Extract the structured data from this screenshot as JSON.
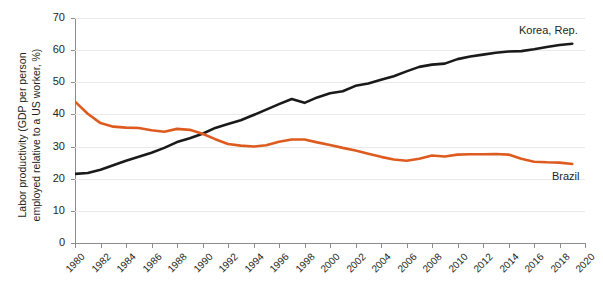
{
  "title_sliver": "",
  "axes": {
    "ylabel_line1": "Labor productivity (GDP per person",
    "ylabel_line2": "employed relative to a US worker, %)",
    "xlabel": "",
    "yticks": [
      "0",
      "10",
      "20",
      "30",
      "40",
      "50",
      "60",
      "70"
    ],
    "xticks": [
      "1980",
      "1982",
      "1984",
      "1986",
      "1988",
      "1990",
      "1992",
      "1994",
      "1996",
      "1998",
      "2000",
      "2002",
      "2004",
      "2006",
      "2008",
      "2010",
      "2012",
      "2014",
      "2016",
      "2018",
      "2020"
    ]
  },
  "labels": {
    "korea": "Korea, Rep.",
    "brazil": "Brazil"
  },
  "colors": {
    "korea": "#1a1a1a",
    "brazil": "#de5b1f",
    "grid": "#e9e9e9",
    "axis": "#8c8c8c",
    "text": "#231f20",
    "background": "#ffffff"
  },
  "chart_data": {
    "type": "line",
    "title": "",
    "xlabel": "",
    "ylabel": "Labor productivity (GDP per person employed relative to a US worker, %)",
    "xlim": [
      1980,
      2020
    ],
    "ylim": [
      0,
      70
    ],
    "grid": true,
    "legend": "inline-end-labels",
    "x": [
      1980,
      1981,
      1982,
      1983,
      1984,
      1985,
      1986,
      1987,
      1988,
      1989,
      1990,
      1991,
      1992,
      1993,
      1994,
      1995,
      1996,
      1997,
      1998,
      1999,
      2000,
      2001,
      2002,
      2003,
      2004,
      2005,
      2006,
      2007,
      2008,
      2009,
      2010,
      2011,
      2012,
      2013,
      2014,
      2015,
      2016,
      2017,
      2018,
      2019
    ],
    "series": [
      {
        "name": "Korea, Rep.",
        "color": "#1a1a1a",
        "values": [
          21.5,
          21.8,
          22.8,
          24.2,
          25.6,
          26.8,
          28.1,
          29.6,
          31.4,
          32.6,
          34.0,
          35.8,
          37.0,
          38.2,
          39.8,
          41.5,
          43.2,
          44.8,
          43.6,
          45.3,
          46.6,
          47.2,
          48.9,
          49.6,
          50.8,
          51.9,
          53.4,
          54.8,
          55.5,
          55.8,
          57.2,
          58.0,
          58.6,
          59.2,
          59.6,
          59.7,
          60.3,
          61.0,
          61.6,
          62.0
        ]
      },
      {
        "name": "Brazil",
        "color": "#de5b1f",
        "values": [
          44.0,
          40.2,
          37.3,
          36.2,
          35.9,
          35.8,
          35.1,
          34.6,
          35.5,
          35.2,
          34.0,
          32.3,
          30.8,
          30.3,
          30.0,
          30.4,
          31.5,
          32.2,
          32.2,
          31.3,
          30.5,
          29.6,
          28.8,
          27.8,
          26.8,
          26.0,
          25.6,
          26.2,
          27.2,
          26.9,
          27.5,
          27.6,
          27.6,
          27.7,
          27.5,
          26.2,
          25.3,
          25.1,
          25.0,
          24.6
        ]
      }
    ]
  }
}
